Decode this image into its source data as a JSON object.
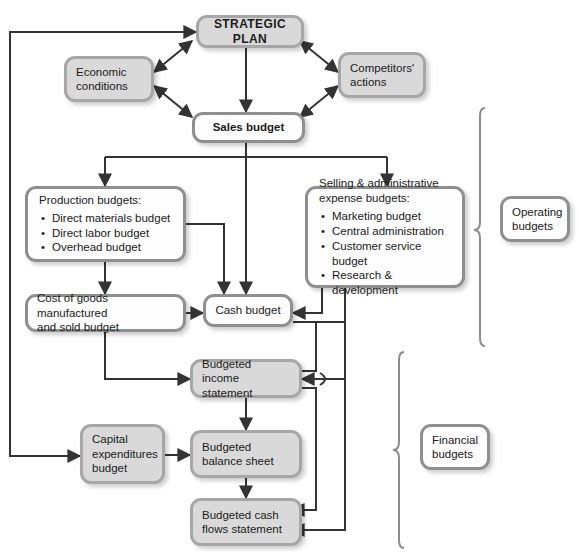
{
  "diagram": {
    "colors": {
      "gray_fill": "#d9d9d9",
      "white_fill": "#fdfdfd",
      "border": "#9e9e9e",
      "line": "#333333",
      "brace": "#8c8c8c"
    }
  },
  "nodes": {
    "strategic_plan": {
      "label": "STRATEGIC PLAN"
    },
    "economic_conditions": {
      "label": "Economic\nconditions"
    },
    "competitors_actions": {
      "label": "Competitors'\nactions"
    },
    "sales_budget": {
      "label": "Sales budget"
    },
    "production_budgets": {
      "lead": "Production budgets:",
      "items": [
        "Direct materials budget",
        "Direct labor budget",
        "Overhead budget"
      ]
    },
    "selling_admin_budgets": {
      "lead": "Selling & administrative\nexpense budgets:",
      "items": [
        "Marketing budget",
        "Central administration",
        "Customer service budget",
        "Research & development"
      ]
    },
    "cogs_budget": {
      "label": "Cost of goods manufactured\nand sold budget"
    },
    "cash_budget": {
      "label": "Cash budget"
    },
    "budgeted_income_statement": {
      "label": "Budgeted\nincome statement"
    },
    "capital_expenditures_budget": {
      "label": "Capital\nexpenditures\nbudget"
    },
    "budgeted_balance_sheet": {
      "label": "Budgeted\nbalance sheet"
    },
    "budgeted_cash_flows_statement": {
      "label": "Budgeted cash\nflows statement"
    },
    "operating_budgets": {
      "label": "Operating\nbudgets"
    },
    "financial_budgets": {
      "label": "Financial\nbudgets"
    }
  }
}
